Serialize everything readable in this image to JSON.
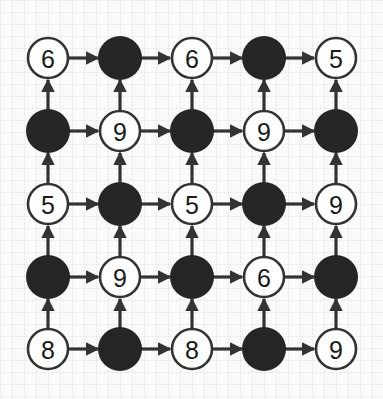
{
  "puzzle": {
    "type": "arrow-graph-grid",
    "rows": 5,
    "cols": 5,
    "colors": {
      "background": "#fafafa",
      "grid_line": "#e6e6e6",
      "node_fill_white": "#ffffff",
      "node_fill_black": "#262626",
      "stroke": "#333333",
      "text": "#1a1a1a"
    },
    "layout": {
      "col_x": [
        48,
        120,
        192,
        264,
        336
      ],
      "row_y": [
        58,
        131,
        204,
        277,
        349
      ],
      "radius": 21
    },
    "nodes": [
      [
        {
          "type": "white",
          "label": "6"
        },
        {
          "type": "black",
          "label": ""
        },
        {
          "type": "white",
          "label": "6"
        },
        {
          "type": "black",
          "label": ""
        },
        {
          "type": "white",
          "label": "5"
        }
      ],
      [
        {
          "type": "black",
          "label": ""
        },
        {
          "type": "white",
          "label": "9"
        },
        {
          "type": "black",
          "label": ""
        },
        {
          "type": "white",
          "label": "9"
        },
        {
          "type": "black",
          "label": ""
        }
      ],
      [
        {
          "type": "white",
          "label": "5"
        },
        {
          "type": "black",
          "label": ""
        },
        {
          "type": "white",
          "label": "5"
        },
        {
          "type": "black",
          "label": ""
        },
        {
          "type": "white",
          "label": "9"
        }
      ],
      [
        {
          "type": "black",
          "label": ""
        },
        {
          "type": "white",
          "label": "9"
        },
        {
          "type": "black",
          "label": ""
        },
        {
          "type": "white",
          "label": "6"
        },
        {
          "type": "black",
          "label": ""
        }
      ],
      [
        {
          "type": "white",
          "label": "8"
        },
        {
          "type": "black",
          "label": ""
        },
        {
          "type": "white",
          "label": "8"
        },
        {
          "type": "black",
          "label": ""
        },
        {
          "type": "white",
          "label": "9"
        }
      ]
    ],
    "arrow_directions": {
      "horizontal": "right",
      "vertical": "up"
    }
  }
}
